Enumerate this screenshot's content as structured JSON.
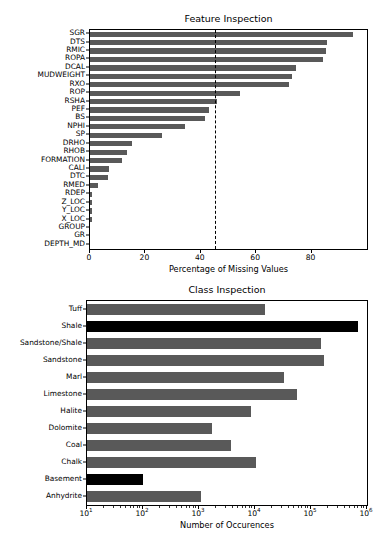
{
  "figure": {
    "width": 391,
    "height": 560,
    "background": "#ffffff",
    "bar_color": "#595959",
    "highlight_color": "#000000"
  },
  "chart_data": [
    {
      "type": "bar",
      "orientation": "horizontal",
      "title": "Feature Inspection",
      "xlabel": "Percentage of Missing Values",
      "ylabel": "",
      "xlim": [
        0,
        100
      ],
      "ylim_categories": 25,
      "grid": false,
      "legend": null,
      "xticks": [
        0,
        20,
        40,
        60,
        80
      ],
      "xticklabels": [
        "0",
        "20",
        "40",
        "60",
        "80"
      ],
      "annotations": [
        {
          "kind": "vline",
          "name": "missing-threshold-line",
          "value": 45,
          "style": "dashed",
          "color": "#000000"
        }
      ],
      "categories": [
        "SGR",
        "DTS",
        "RMIC",
        "ROPA",
        "DCAL",
        "MUDWEIGHT",
        "RXO",
        "ROP",
        "RSHA",
        "PEF",
        "BS",
        "NPHI",
        "SP",
        "DRHO",
        "RHOB",
        "FORMATION",
        "CALI",
        "DTC",
        "RMED",
        "RDEP",
        "Z_LOC",
        "Y_LOC",
        "X_LOC",
        "GROUP",
        "GR",
        "DEPTH_MD"
      ],
      "values": [
        94.8,
        85.6,
        85.3,
        84.0,
        74.5,
        73.0,
        72.0,
        54.0,
        46.0,
        43.0,
        41.5,
        34.2,
        26.0,
        15.0,
        13.5,
        11.5,
        7.0,
        6.5,
        3.0,
        0.9,
        0.9,
        0.9,
        0.9,
        0.0,
        0.0,
        0.0
      ]
    },
    {
      "type": "bar",
      "orientation": "horizontal",
      "title": "Class Inspection",
      "xlabel": "Number of Occurences",
      "ylabel": "",
      "xscale": "log",
      "xlim": [
        10,
        1000000
      ],
      "grid": false,
      "legend": null,
      "xticks": [
        10,
        100,
        1000,
        10000,
        100000,
        1000000
      ],
      "xticklabels": [
        "10",
        "10",
        "10",
        "10",
        "10",
        "10"
      ],
      "xtick_exponents": [
        "1",
        "2",
        "3",
        "4",
        "5",
        "6"
      ],
      "categories": [
        "Tuff",
        "Shale",
        "Sandstone/Shale",
        "Sandstone",
        "Marl",
        "Limestone",
        "Halite",
        "Dolomite",
        "Coal",
        "Chalk",
        "Basement",
        "Anhydrite"
      ],
      "values": [
        15000,
        700000,
        150000,
        170000,
        33000,
        57000,
        8500,
        1700,
        3800,
        10500,
        100,
        1100
      ],
      "highlighted": [
        "Shale",
        "Basement"
      ]
    }
  ]
}
